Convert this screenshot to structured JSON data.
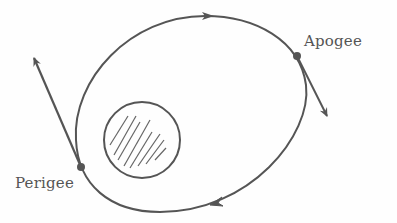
{
  "diagram": {
    "labels": {
      "apogee": "Apogee",
      "perigee": "Perigee"
    },
    "colors": {
      "stroke": "#555555",
      "background": "#fefefe"
    }
  }
}
